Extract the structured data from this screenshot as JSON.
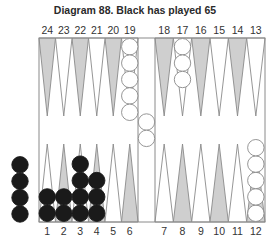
{
  "title": "Diagram 88.  Black has played 65",
  "colors": {
    "shaded_point": "#cfcfcf",
    "line": "#8a8a8a",
    "black_checker": "#1a1a1a",
    "white_checker": "#ffffff"
  },
  "top_labels_left": [
    "24",
    "23",
    "22",
    "21",
    "20",
    "19"
  ],
  "top_labels_right": [
    "18",
    "17",
    "16",
    "15",
    "14",
    "13"
  ],
  "bottom_labels_left": [
    "1",
    "2",
    "3",
    "4",
    "5",
    "6"
  ],
  "bottom_labels_right": [
    "7",
    "8",
    "9",
    "10",
    "11",
    "12"
  ],
  "positions": {
    "white": [
      {
        "point": 19,
        "count": 5
      },
      {
        "point": 17,
        "count": 3
      },
      {
        "point": 12,
        "count": 5
      },
      {
        "point": "bar",
        "count": 2
      }
    ],
    "black": [
      {
        "point": 1,
        "count": 2
      },
      {
        "point": 2,
        "count": 2
      },
      {
        "point": 3,
        "count": 4
      },
      {
        "point": 4,
        "count": 3
      },
      {
        "point": "off",
        "count": 4
      }
    ]
  }
}
